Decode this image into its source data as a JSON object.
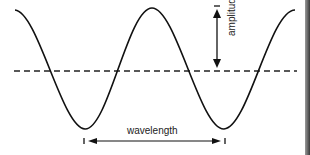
{
  "diagram": {
    "labels": {
      "amplitude": "amplitude",
      "wavelength": "wavelength"
    },
    "colors": {
      "curve": "#111111",
      "dashed_line": "#222222",
      "arrow": "#111111",
      "background": "#ffffff"
    },
    "elements": [
      {
        "type": "wave",
        "shape": "cosine",
        "peaks": 2,
        "troughs": 2
      },
      {
        "type": "equilibrium-line",
        "style": "dashed"
      },
      {
        "type": "arrow",
        "direction": "vertical",
        "label": "amplitude",
        "meaning": "distance from equilibrium line to crest"
      },
      {
        "type": "arrow",
        "direction": "horizontal",
        "label": "wavelength",
        "meaning": "distance between consecutive troughs"
      }
    ]
  }
}
